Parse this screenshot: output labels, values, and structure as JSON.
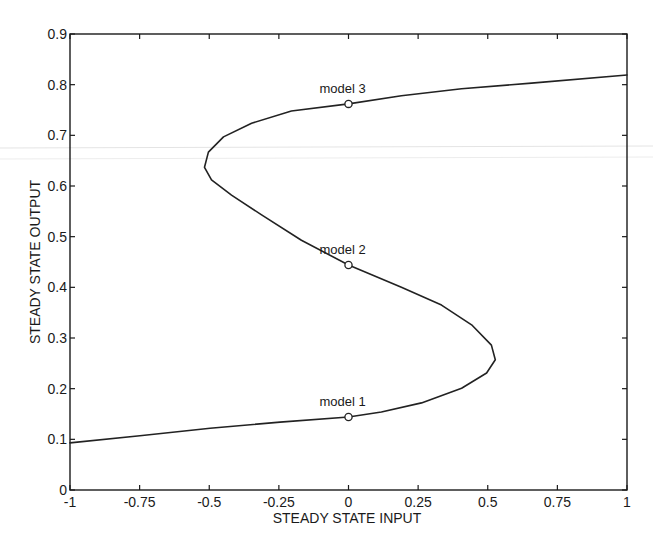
{
  "chart_data": {
    "type": "line",
    "title": "",
    "xlabel": "STEADY STATE INPUT",
    "ylabel": "STEADY STATE OUTPUT",
    "xlim": [
      -1,
      1
    ],
    "ylim": [
      0,
      0.9
    ],
    "grid": false,
    "legend": null,
    "xticks": [
      -1,
      -0.75,
      -0.5,
      -0.25,
      0,
      0.25,
      0.5,
      0.75,
      1
    ],
    "xtick_labels": [
      "-1",
      "-0.75",
      "-0.5",
      "-0.25",
      "0",
      "0.25",
      "0.5",
      "0.75",
      "1"
    ],
    "yticks": [
      0,
      0.1,
      0.2,
      0.3,
      0.4,
      0.5,
      0.6,
      0.7,
      0.8,
      0.9
    ],
    "ytick_labels": [
      "0",
      "0.1",
      "0.2",
      "0.3",
      "0.4",
      "0.5",
      "0.6",
      "0.7",
      "0.8",
      "0.9"
    ],
    "series": [
      {
        "name": "steady-state curve",
        "x": [
          -1.0,
          -0.749,
          -0.497,
          -0.246,
          0.0,
          0.118,
          0.262,
          0.406,
          0.496,
          0.527,
          0.513,
          0.442,
          0.334,
          0.19,
          0.0,
          -0.169,
          -0.312,
          -0.42,
          -0.492,
          -0.517,
          -0.503,
          -0.449,
          -0.348,
          -0.205,
          0.0,
          0.19,
          0.406,
          0.657,
          1.0
        ],
        "y": [
          0.093,
          0.107,
          0.122,
          0.134,
          0.144,
          0.154,
          0.172,
          0.201,
          0.231,
          0.257,
          0.286,
          0.326,
          0.365,
          0.4,
          0.444,
          0.493,
          0.543,
          0.582,
          0.612,
          0.637,
          0.667,
          0.697,
          0.724,
          0.748,
          0.762,
          0.778,
          0.792,
          0.803,
          0.819
        ]
      }
    ],
    "markers": [
      {
        "label": "model 1",
        "x": 0,
        "y": 0.144
      },
      {
        "label": "model 2",
        "x": 0,
        "y": 0.444
      },
      {
        "label": "model 3",
        "x": 0,
        "y": 0.762
      }
    ],
    "annotations": [
      "model 1",
      "model 2",
      "model 3"
    ]
  }
}
